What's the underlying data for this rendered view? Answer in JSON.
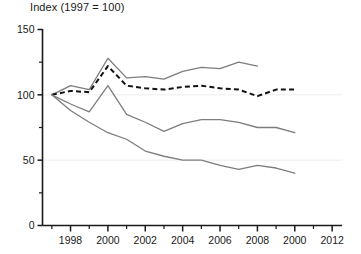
{
  "chart_data": {
    "type": "line",
    "title": "Index (1997 = 100)",
    "xlabel": "",
    "ylabel": "",
    "xlim": [
      1996.5,
      2012.5
    ],
    "ylim": [
      0,
      150
    ],
    "grid": true,
    "gridlines_y": [
      50,
      100
    ],
    "legend": "none",
    "y_ticks_major": [
      0,
      50,
      100,
      150
    ],
    "y_tick_labels": [
      "0",
      "50",
      "100",
      "150"
    ],
    "y_ticks_minor": [
      25,
      75,
      125
    ],
    "x_ticks": [
      1997,
      1998,
      1999,
      2000,
      2001,
      2002,
      2003,
      2004,
      2005,
      2006,
      2007,
      2008,
      2009,
      2010,
      2011,
      2012
    ],
    "x_tick_labels_shown": [
      {
        "x": 1998,
        "label": "1998"
      },
      {
        "x": 2000,
        "label": "2000"
      },
      {
        "x": 2002,
        "label": "2002"
      },
      {
        "x": 2004,
        "label": "2004"
      },
      {
        "x": 2006,
        "label": "2006"
      },
      {
        "x": 2008,
        "label": "2008"
      },
      {
        "x": 2010,
        "label": "2000"
      },
      {
        "x": 2012,
        "label": "2012"
      }
    ],
    "series": [
      {
        "name": "upper-grey-line",
        "style": "solid",
        "color": "#7d7d7d",
        "x": [
          1997,
          1998,
          1999,
          2000,
          2001,
          2002,
          2003,
          2004,
          2005,
          2006,
          2007,
          2008
        ],
        "values": [
          100,
          107,
          104,
          128,
          113,
          114,
          112,
          118,
          121,
          120,
          125,
          122
        ]
      },
      {
        "name": "dashed-black-line",
        "style": "dashed",
        "color": "#111111",
        "x": [
          1997,
          1998,
          1999,
          2000,
          2001,
          2002,
          2003,
          2004,
          2005,
          2006,
          2007,
          2008,
          2009,
          2010
        ],
        "values": [
          100,
          103,
          102,
          122,
          107,
          105,
          104,
          106,
          107,
          105,
          104,
          99,
          104,
          104
        ]
      },
      {
        "name": "middle-grey-line",
        "style": "solid",
        "color": "#7d7d7d",
        "x": [
          1997,
          1998,
          1999,
          2000,
          2001,
          2002,
          2003,
          2004,
          2005,
          2006,
          2007,
          2008,
          2009,
          2010
        ],
        "values": [
          100,
          93,
          87,
          107,
          85,
          79,
          72,
          78,
          81,
          81,
          79,
          75,
          75,
          71
        ]
      },
      {
        "name": "lower-grey-line",
        "style": "solid",
        "color": "#7d7d7d",
        "x": [
          1997,
          1998,
          1999,
          2000,
          2001,
          2002,
          2003,
          2004,
          2005,
          2006,
          2007,
          2008,
          2009,
          2010
        ],
        "values": [
          100,
          88,
          79,
          71,
          66,
          57,
          53,
          50,
          50,
          46,
          43,
          46,
          44,
          40
        ]
      }
    ]
  }
}
